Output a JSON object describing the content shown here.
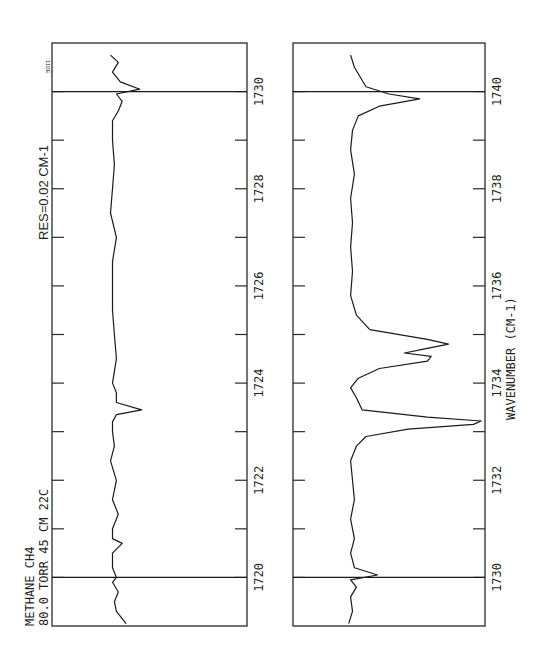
{
  "figure": {
    "corner_mark": "110E",
    "sample_label_line1": "METHANE   CH4",
    "sample_label_line2": "80.0 TORR  45 CM  22C",
    "resolution_label": "RES=0.02  CM-1",
    "x_axis_label": "WAVENUMBER (CM-1)"
  },
  "chart_data": [
    {
      "type": "line",
      "title": "Methane CH4 spectrum, 1719-1731 cm-1",
      "xlabel": "",
      "ylabel": "Transmittance (arb.)",
      "orientation": "rotated 90 deg CCW (wavenumber runs bottom-to-top)",
      "xlim": [
        1719.0,
        1731.0
      ],
      "ylim": [
        0,
        1
      ],
      "grid": false,
      "tick_labels": [
        "1720",
        "1722",
        "1724",
        "1726",
        "1728",
        "1730"
      ],
      "major_ticks": [
        1720,
        1722,
        1724,
        1726,
        1728,
        1730
      ],
      "minor_ticks": [
        1721,
        1723,
        1725,
        1727,
        1729
      ],
      "reference_lines": [
        1720,
        1730
      ],
      "annotations": [
        "METHANE CH4",
        "80.0 TORR 45 CM 22C",
        "RES=0.02 CM-1"
      ],
      "series": [
        {
          "name": "absorbance trace",
          "x": [
            1719.05,
            1719.3,
            1719.5,
            1719.7,
            1719.9,
            1720.0,
            1720.2,
            1720.5,
            1720.7,
            1720.8,
            1721.0,
            1721.3,
            1721.6,
            1722.0,
            1722.4,
            1722.7,
            1723.0,
            1723.2,
            1723.35,
            1723.45,
            1723.6,
            1723.8,
            1724.0,
            1724.5,
            1725.0,
            1725.5,
            1726.0,
            1726.5,
            1727.0,
            1727.5,
            1728.0,
            1728.5,
            1729.0,
            1729.4,
            1729.6,
            1729.8,
            1729.95,
            1730.05,
            1730.2,
            1730.4,
            1730.6,
            1730.75
          ],
          "y": [
            0.38,
            0.33,
            0.32,
            0.34,
            0.31,
            0.33,
            0.31,
            0.31,
            0.36,
            0.31,
            0.31,
            0.34,
            0.31,
            0.33,
            0.3,
            0.32,
            0.31,
            0.31,
            0.33,
            0.46,
            0.33,
            0.33,
            0.31,
            0.33,
            0.32,
            0.31,
            0.31,
            0.31,
            0.33,
            0.3,
            0.31,
            0.32,
            0.31,
            0.31,
            0.34,
            0.36,
            0.33,
            0.45,
            0.35,
            0.31,
            0.34,
            0.3
          ]
        }
      ]
    },
    {
      "type": "line",
      "title": "Methane CH4 spectrum, 1729-1741 cm-1",
      "xlabel": "WAVENUMBER (CM-1)",
      "ylabel": "Transmittance (arb.)",
      "orientation": "rotated 90 deg CCW (wavenumber runs bottom-to-top)",
      "xlim": [
        1729.0,
        1741.0
      ],
      "ylim": [
        0,
        1
      ],
      "grid": false,
      "tick_labels": [
        "1730",
        "1732",
        "1734",
        "1736",
        "1738",
        "1740"
      ],
      "major_ticks": [
        1730,
        1732,
        1734,
        1736,
        1738,
        1740
      ],
      "minor_ticks": [
        1731,
        1733,
        1735,
        1737,
        1739
      ],
      "reference_lines": [
        1730,
        1740
      ],
      "series": [
        {
          "name": "absorbance trace",
          "x": [
            1729.05,
            1729.3,
            1729.6,
            1729.8,
            1729.95,
            1730.05,
            1730.2,
            1730.5,
            1730.8,
            1731.2,
            1731.6,
            1732.0,
            1732.4,
            1732.7,
            1732.9,
            1733.05,
            1733.15,
            1733.22,
            1733.3,
            1733.45,
            1733.7,
            1733.9,
            1734.1,
            1734.3,
            1734.45,
            1734.55,
            1734.62,
            1734.7,
            1734.8,
            1734.9,
            1735.1,
            1735.4,
            1735.8,
            1736.3,
            1736.8,
            1737.3,
            1737.8,
            1738.3,
            1738.8,
            1739.2,
            1739.5,
            1739.7,
            1739.85,
            1739.95,
            1740.1,
            1740.3,
            1740.5,
            1740.75
          ],
          "y": [
            0.29,
            0.31,
            0.3,
            0.33,
            0.3,
            0.44,
            0.32,
            0.3,
            0.32,
            0.3,
            0.32,
            0.31,
            0.3,
            0.33,
            0.38,
            0.6,
            0.94,
            0.98,
            0.7,
            0.36,
            0.33,
            0.3,
            0.34,
            0.45,
            0.7,
            0.72,
            0.58,
            0.68,
            0.81,
            0.7,
            0.4,
            0.33,
            0.3,
            0.31,
            0.3,
            0.31,
            0.3,
            0.32,
            0.3,
            0.31,
            0.34,
            0.45,
            0.66,
            0.5,
            0.38,
            0.35,
            0.32,
            0.3
          ]
        }
      ]
    }
  ]
}
